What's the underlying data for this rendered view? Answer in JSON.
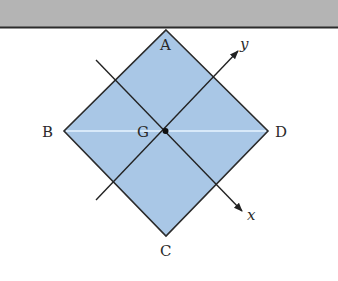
{
  "diagram": {
    "type": "square plate suspended from vertex A with centroid G and rotated axes",
    "colors": {
      "ceiling": "#b4b4b4",
      "ceiling_edge": "#2b2b2b",
      "plate_fill": "#a9c7e6",
      "plate_edge": "#2b2b2b",
      "diagonal_bd": "#e8f4ff",
      "axis_line": "#222222",
      "point": "#111111"
    },
    "ceiling": {
      "label": ""
    },
    "vertices": {
      "A": {
        "label": "A",
        "x": 166,
        "y": 30
      },
      "B": {
        "label": "B",
        "x": 64,
        "y": 131
      },
      "C": {
        "label": "C",
        "x": 166,
        "y": 236
      },
      "D": {
        "label": "D",
        "x": 268,
        "y": 131
      }
    },
    "center": {
      "label": "G",
      "x": 165,
      "y": 131
    },
    "axes": {
      "x": {
        "label": "x",
        "from": [
          96,
          60
        ],
        "to": [
          242,
          211
        ]
      },
      "y": {
        "label": "y",
        "from": [
          96,
          200
        ],
        "to": [
          238,
          51
        ]
      }
    }
  }
}
